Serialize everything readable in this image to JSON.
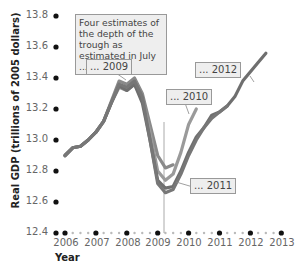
{
  "chart_data": {
    "type": "line",
    "title": "",
    "xlabel": "Year",
    "ylabel": "Real GDP (trillions of 2005 dollars)",
    "xlim": [
      2006,
      2013
    ],
    "ylim": [
      12.4,
      13.8
    ],
    "x_ticks": [
      "2006",
      "2007",
      "2008",
      "2009",
      "2010",
      "2011",
      "2012",
      "2013"
    ],
    "y_ticks": [
      "12.4",
      "12.6",
      "12.8",
      "13.0",
      "13.2",
      "13.4",
      "13.6",
      "13.8"
    ],
    "grid": false,
    "annotation": "Four estimates of the depth of the trough as estimated in July ...",
    "vertical_marker_x": 2009.25,
    "series": [
      {
        "name": "... 2009",
        "color": "#8a8a8a",
        "x": [
          2006.0,
          2006.25,
          2006.5,
          2006.75,
          2007.0,
          2007.25,
          2007.5,
          2007.75,
          2008.0,
          2008.25,
          2008.5,
          2008.75,
          2009.0,
          2009.25,
          2009.5
        ],
        "y": [
          12.9,
          12.95,
          12.96,
          13.0,
          13.05,
          13.12,
          13.25,
          13.38,
          13.36,
          13.4,
          13.3,
          13.1,
          12.9,
          12.82,
          12.84
        ]
      },
      {
        "name": "... 2010",
        "color": "#9a9a9a",
        "x": [
          2006.0,
          2006.25,
          2006.5,
          2006.75,
          2007.0,
          2007.25,
          2007.5,
          2007.75,
          2008.0,
          2008.25,
          2008.5,
          2008.75,
          2009.0,
          2009.25,
          2009.5,
          2009.75,
          2010.0,
          2010.25
        ],
        "y": [
          12.9,
          12.95,
          12.96,
          13.0,
          13.05,
          13.12,
          13.24,
          13.34,
          13.32,
          13.36,
          13.26,
          13.05,
          12.8,
          12.74,
          12.78,
          12.92,
          13.1,
          13.2
        ]
      },
      {
        "name": "... 2011",
        "color": "#777777",
        "x": [
          2006.0,
          2006.25,
          2006.5,
          2006.75,
          2007.0,
          2007.25,
          2007.5,
          2007.75,
          2008.0,
          2008.25,
          2008.5,
          2008.75,
          2009.0,
          2009.25,
          2009.5,
          2009.75,
          2010.0,
          2010.25,
          2010.5,
          2010.75,
          2011.0,
          2011.25
        ],
        "y": [
          12.9,
          12.95,
          12.96,
          13.0,
          13.05,
          13.12,
          13.24,
          13.36,
          13.34,
          13.38,
          13.28,
          13.0,
          12.72,
          12.66,
          12.68,
          12.78,
          12.9,
          13.0,
          13.08,
          13.14,
          13.18,
          13.22
        ]
      },
      {
        "name": "... 2012",
        "color": "#6f6f6f",
        "x": [
          2006.0,
          2006.25,
          2006.5,
          2006.75,
          2007.0,
          2007.25,
          2007.5,
          2007.75,
          2008.0,
          2008.25,
          2008.5,
          2008.75,
          2009.0,
          2009.25,
          2009.5,
          2009.75,
          2010.0,
          2010.25,
          2010.5,
          2010.75,
          2011.0,
          2011.25,
          2011.5,
          2011.75,
          2012.0,
          2012.25,
          2012.5
        ],
        "y": [
          12.9,
          12.95,
          12.96,
          13.0,
          13.05,
          13.12,
          13.24,
          13.35,
          13.32,
          13.36,
          13.24,
          13.0,
          12.74,
          12.69,
          12.7,
          12.8,
          12.92,
          13.02,
          13.08,
          13.16,
          13.18,
          13.22,
          13.28,
          13.38,
          13.44,
          13.5,
          13.56
        ]
      }
    ]
  },
  "labels": {
    "xlabel": "Year",
    "ylabel": "Real GDP (trillions of 2005 dollars)",
    "annotation": "Four estimates of the depth of the trough as estimated in July ...",
    "tag_2009": "... 2009",
    "tag_2010": "... 2010",
    "tag_2011": "... 2011",
    "tag_2012": "... 2012"
  },
  "y_ticks": [
    "13.8",
    "13.6",
    "13.4",
    "13.2",
    "13.0",
    "12.8",
    "12.6",
    "12.4"
  ],
  "x_ticks": [
    "2006",
    "2007",
    "2008",
    "2009",
    "2010",
    "2011",
    "2012",
    "2013"
  ]
}
